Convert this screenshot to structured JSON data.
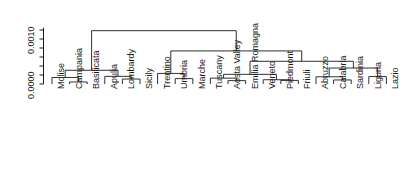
{
  "chart_data": {
    "type": "dendrogram",
    "title": "",
    "xlabel": "",
    "ylabel": "",
    "axis": {
      "orientation": "vertical-left",
      "tick_labels": [
        "0.0000",
        "0.0010"
      ],
      "tick_values": [
        0.0,
        0.001
      ],
      "minor_ticks": [
        0.0002,
        0.0004,
        0.0006,
        0.0008,
        0.0012
      ],
      "ylim": [
        0.0,
        0.00125
      ],
      "grid": false,
      "rotation_deg": 90
    },
    "legend": null,
    "leaves": [
      "Molise",
      "Campania",
      "Basilicata",
      "Apulia",
      "Lombardy",
      "Sicily",
      "Trentino",
      "Umbria",
      "Marche",
      "Tuscany",
      "Aosta Valley",
      "Emilia Romagna",
      "Veneto",
      "Piedmont",
      "Friuli",
      "Abruzzo",
      "Calabria",
      "Sardinia",
      "Liguria",
      "Lazio"
    ],
    "merges": [
      {
        "id": "m1",
        "left": "Campania",
        "right": "Basilicata",
        "height": 4.5e-05
      },
      {
        "id": "m2",
        "left": "Molise",
        "right": "m1",
        "height": 0.000145
      },
      {
        "id": "m3",
        "left": "Lombardy",
        "right": "Sicily",
        "height": 0.00011
      },
      {
        "id": "m4",
        "left": "Apulia",
        "right": "m3",
        "height": 0.00017
      },
      {
        "id": "m5",
        "left": "m2",
        "right": "m4",
        "height": 0.000305
      },
      {
        "id": "m6",
        "left": "Umbria",
        "right": "Marche",
        "height": 0.00012
      },
      {
        "id": "m7",
        "left": "Trentino",
        "right": "m6",
        "height": 0.000235
      },
      {
        "id": "m8",
        "left": "Aosta Valley",
        "right": "Emilia Romagna",
        "height": 7.5e-05
      },
      {
        "id": "m9",
        "left": "Tuscany",
        "right": "m8",
        "height": 0.00013
      },
      {
        "id": "m10",
        "left": "Piedmont",
        "right": "Friuli",
        "height": 8e-05
      },
      {
        "id": "m11",
        "left": "Veneto",
        "right": "m10",
        "height": 9.5e-05
      },
      {
        "id": "m12",
        "left": "m9",
        "right": "m11",
        "height": 0.000215
      },
      {
        "id": "m13",
        "left": "Calabria",
        "right": "Sardinia",
        "height": 9e-05
      },
      {
        "id": "m14",
        "left": "Abruzzo",
        "right": "m13",
        "height": 0.00016
      },
      {
        "id": "m15",
        "left": "Liguria",
        "right": "Lazio",
        "height": 0.000165
      },
      {
        "id": "m16",
        "left": "m14",
        "right": "m15",
        "height": 0.000355
      },
      {
        "id": "m17",
        "left": "m12",
        "right": "m16",
        "height": 0.000505
      },
      {
        "id": "m18",
        "left": "m7",
        "right": "m17",
        "height": 0.000735
      },
      {
        "id": "m19",
        "left": "m5",
        "right": "m18",
        "height": 0.001185
      }
    ]
  }
}
